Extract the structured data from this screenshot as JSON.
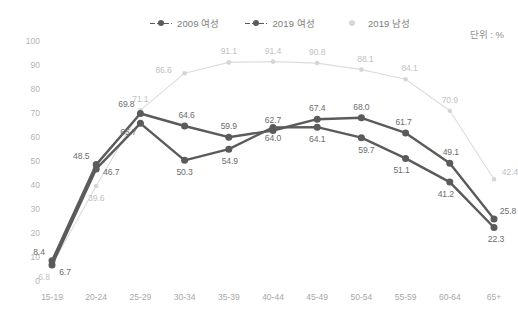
{
  "unit_note": "단위 : %",
  "legend": {
    "items": [
      {
        "label": "2009 여성",
        "style": "dashed-dot",
        "color": "#5b5b5b",
        "key": "women_2009"
      },
      {
        "label": "2019 여성",
        "style": "dashed-dot",
        "color": "#5b5b5b",
        "key": "women_2019"
      },
      {
        "label": "2019 남성",
        "style": "dot",
        "color": "#d8d8d8",
        "key": "men_2019"
      }
    ]
  },
  "chart_data": {
    "type": "line",
    "title": "",
    "subtitle": "",
    "xlabel": "",
    "ylabel": "",
    "ylim": [
      0,
      100
    ],
    "ytick_step": 10,
    "yticks": [
      "100",
      "90",
      "80",
      "70",
      "60",
      "50",
      "40",
      "30",
      "20",
      "10",
      "0"
    ],
    "grid": false,
    "legend_position": "top-center",
    "annotations": [
      "단위 : %"
    ],
    "categories": [
      "15-19",
      "20-24",
      "25-29",
      "30-34",
      "35-39",
      "40-44",
      "45-49",
      "50-54",
      "55-59",
      "60-64",
      "65+"
    ],
    "series": [
      {
        "name": "2009 여성",
        "color": "#5b5b5b",
        "values": [
          8.4,
          48.5,
          69.8,
          64.6,
          59.9,
          62.7,
          67.4,
          68.0,
          61.7,
          49.1,
          25.8
        ],
        "labels": [
          "8.4",
          "48.5",
          "69.8",
          "64.6",
          "59.9",
          "62.7",
          "67.4",
          "68.0",
          "61.7",
          "49.1",
          "25.8"
        ]
      },
      {
        "name": "2019 여성",
        "color": "#5b5b5b",
        "values": [
          6.7,
          46.7,
          65.7,
          50.3,
          54.9,
          64.0,
          64.1,
          59.7,
          51.1,
          41.2,
          22.3
        ],
        "labels": [
          "6.7",
          "46.7",
          "65.7",
          "50.3",
          "54.9",
          "64.0",
          "64.1",
          "59.7",
          "51.1",
          "41.2",
          "22.3"
        ]
      },
      {
        "name": "2019 남성",
        "color": "#dcdcdc",
        "values": [
          6.8,
          39.6,
          71.1,
          86.6,
          91.1,
          91.4,
          90.8,
          88.1,
          84.1,
          70.9,
          42.4
        ],
        "labels": [
          "6.8",
          "39.6",
          "71.1",
          "86.6",
          "91.1",
          "91.4",
          "90.8",
          "88.1",
          "84.1",
          "70.9",
          "42.4"
        ]
      }
    ],
    "label_offsets": {
      "2009 여성": [
        [
          -13,
          -9
        ],
        [
          -15,
          -9
        ],
        [
          -14,
          -9
        ],
        [
          2,
          -11
        ],
        [
          0,
          -11
        ],
        [
          0,
          -11
        ],
        [
          0,
          -11
        ],
        [
          0,
          -11
        ],
        [
          -2,
          -11
        ],
        [
          1,
          -11
        ],
        [
          14,
          -8
        ]
      ],
      "2019 여성": [
        [
          13,
          7
        ],
        [
          15,
          3
        ],
        [
          -12,
          9
        ],
        [
          0,
          12
        ],
        [
          1,
          12
        ],
        [
          0,
          11
        ],
        [
          0,
          12
        ],
        [
          5,
          12
        ],
        [
          -4,
          12
        ],
        [
          -4,
          12
        ],
        [
          2,
          12
        ]
      ],
      "2019 남성": [
        [
          -8,
          12
        ],
        [
          0,
          12
        ],
        [
          0,
          -11
        ],
        [
          -21,
          -3
        ],
        [
          0,
          -11
        ],
        [
          0,
          -11
        ],
        [
          0,
          -11
        ],
        [
          4,
          -11
        ],
        [
          4,
          -11
        ],
        [
          0,
          -11
        ],
        [
          16,
          -7
        ]
      ]
    }
  }
}
